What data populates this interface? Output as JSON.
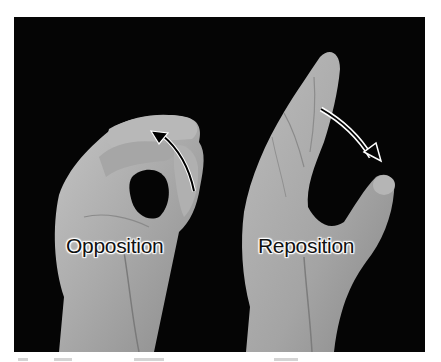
{
  "figure": {
    "labels": {
      "left": "Opposition",
      "right": "Reposition"
    },
    "colors": {
      "background": "#050505",
      "skin_light": "#bdbdbd",
      "skin_mid": "#9a9a9a",
      "skin_dark": "#6e6e6e",
      "label_text": "#111111",
      "label_halo": "#ffffff"
    },
    "arrows": {
      "left": "solid black curved arrow (thumb moving toward fingertips)",
      "right": "hollow white curved arrow (thumb moving away)"
    }
  }
}
